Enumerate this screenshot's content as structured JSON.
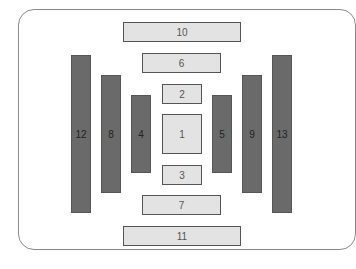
{
  "diagram": {
    "colors": {
      "light_fill": "#e3e3e3",
      "dark_fill": "#6a6a6a",
      "border": "#555555",
      "frame": "#8a8a8a"
    },
    "boxes": [
      {
        "label": "1",
        "kind": "light",
        "x": 162,
        "y": 114,
        "w": 40,
        "h": 40
      },
      {
        "label": "2",
        "kind": "light",
        "x": 162,
        "y": 84,
        "w": 40,
        "h": 20
      },
      {
        "label": "3",
        "kind": "light",
        "x": 162,
        "y": 165,
        "w": 40,
        "h": 20
      },
      {
        "label": "4",
        "kind": "dark",
        "x": 131,
        "y": 95,
        "w": 20,
        "h": 78
      },
      {
        "label": "5",
        "kind": "dark",
        "x": 212,
        "y": 95,
        "w": 20,
        "h": 78
      },
      {
        "label": "6",
        "kind": "light",
        "x": 142,
        "y": 53,
        "w": 79,
        "h": 20
      },
      {
        "label": "7",
        "kind": "light",
        "x": 142,
        "y": 195,
        "w": 79,
        "h": 20
      },
      {
        "label": "8",
        "kind": "dark",
        "x": 101,
        "y": 75,
        "w": 20,
        "h": 118
      },
      {
        "label": "9",
        "kind": "dark",
        "x": 242,
        "y": 75,
        "w": 20,
        "h": 118
      },
      {
        "label": "10",
        "kind": "light",
        "x": 123,
        "y": 22,
        "w": 118,
        "h": 20
      },
      {
        "label": "11",
        "kind": "light",
        "x": 123,
        "y": 226,
        "w": 118,
        "h": 20
      },
      {
        "label": "12",
        "kind": "dark",
        "x": 71,
        "y": 55,
        "w": 20,
        "h": 158
      },
      {
        "label": "13",
        "kind": "dark",
        "x": 272,
        "y": 55,
        "w": 20,
        "h": 158
      }
    ]
  }
}
